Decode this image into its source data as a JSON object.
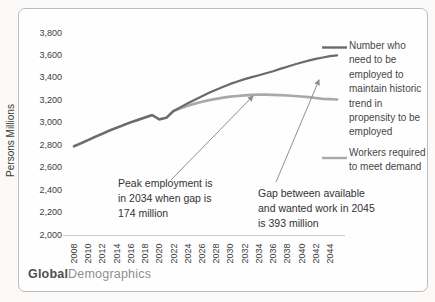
{
  "brand": {
    "bold": "Global",
    "regular": "Demographics"
  },
  "colors": {
    "series_need": "#6a6a6a",
    "series_workers": "#a9a9a9",
    "axis_line": "#c9c9c9",
    "arrow": "#8f8f8f",
    "frame_border": "#bdbdbd",
    "text": "#3d3d3d"
  },
  "chart_data": {
    "type": "line",
    "title": "",
    "xlabel": "",
    "ylabel": "Persons Millions",
    "ylim": [
      2000,
      3800
    ],
    "y_tick_step": 200,
    "grid": false,
    "legend_position": "right",
    "x_tick_years": [
      2008,
      2010,
      2012,
      2014,
      2016,
      2018,
      2020,
      2022,
      2024,
      2026,
      2028,
      2030,
      2032,
      2034,
      2036,
      2038,
      2040,
      2042,
      2044
    ],
    "x_years": [
      2008,
      2009,
      2010,
      2011,
      2012,
      2013,
      2014,
      2015,
      2016,
      2017,
      2018,
      2019,
      2020,
      2021,
      2022,
      2023,
      2024,
      2025,
      2026,
      2027,
      2028,
      2029,
      2030,
      2031,
      2032,
      2033,
      2034,
      2035,
      2036,
      2037,
      2038,
      2039,
      2040,
      2041,
      2042,
      2043,
      2044,
      2045
    ],
    "series": [
      {
        "name": "Number who\nneed to be\nemployed to\nmaintain historic\ntrend in\npropensity to be\nemployed",
        "color": "#6a6a6a",
        "values": [
          2790,
          2818,
          2846,
          2875,
          2903,
          2930,
          2956,
          2981,
          3004,
          3026,
          3048,
          3068,
          3030,
          3044,
          3105,
          3140,
          3174,
          3206,
          3237,
          3267,
          3295,
          3321,
          3346,
          3368,
          3389,
          3407,
          3424,
          3442,
          3460,
          3480,
          3500,
          3519,
          3537,
          3554,
          3569,
          3582,
          3593,
          3600
        ]
      },
      {
        "name": "Workers required\nto meet demand",
        "color": "#a9a9a9",
        "values": [
          2790,
          2818,
          2846,
          2875,
          2903,
          2930,
          2956,
          2981,
          3004,
          3026,
          3048,
          3068,
          3030,
          3044,
          3105,
          3130,
          3152,
          3171,
          3188,
          3202,
          3214,
          3224,
          3232,
          3239,
          3244,
          3248,
          3250,
          3250,
          3249,
          3246,
          3243,
          3239,
          3234,
          3228,
          3221,
          3214,
          3210,
          3207
        ]
      }
    ],
    "annotations": [
      {
        "id": "peak",
        "text": "Peak employment is\nin 2034 when gap is\n174 million"
      },
      {
        "id": "gap",
        "text": "Gap between available\nand wanted work in 2045\nis 393 million"
      }
    ]
  }
}
